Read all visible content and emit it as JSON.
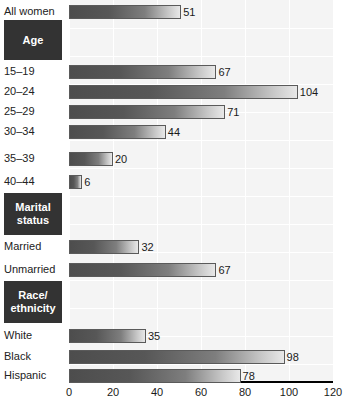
{
  "chart_data": {
    "type": "bar",
    "orientation": "horizontal",
    "title": "",
    "xlabel": "",
    "ylabel": "",
    "xlim": [
      0,
      120
    ],
    "xticks": [
      0,
      20,
      40,
      60,
      80,
      100,
      120
    ],
    "grid": true,
    "legend": null,
    "categories": [
      "All women",
      "15–19",
      "20–24",
      "25–29",
      "30–34",
      "35–39",
      "40–44",
      "Married",
      "Unmarried",
      "White",
      "Black",
      "Hispanic"
    ],
    "values": [
      51,
      67,
      104,
      71,
      44,
      20,
      6,
      32,
      67,
      35,
      98,
      78
    ],
    "group_headers": [
      "Age",
      "Marital status",
      "Race/ethnicity"
    ]
  },
  "rows": [
    {
      "kind": "bar",
      "label": "All women",
      "value": 51,
      "value_text": "51",
      "top": 2
    },
    {
      "kind": "group",
      "label": "Age",
      "top": 20,
      "height": 40
    },
    {
      "kind": "bar",
      "label": "15–19",
      "value": 67,
      "value_text": "67",
      "top": 62
    },
    {
      "kind": "bar",
      "label": "20–24",
      "value": 104,
      "value_text": "104",
      "top": 82
    },
    {
      "kind": "bar",
      "label": "25–29",
      "value": 71,
      "value_text": "71",
      "top": 102
    },
    {
      "kind": "bar",
      "label": "30–34",
      "value": 44,
      "value_text": "44",
      "top": 122
    },
    {
      "kind": "bar",
      "label": "35–39",
      "value": 20,
      "value_text": "20",
      "top": 149
    },
    {
      "kind": "bar",
      "label": "40–44",
      "value": 6,
      "value_text": "6",
      "top": 172
    },
    {
      "kind": "group",
      "label": "Marital\nstatus",
      "top": 193,
      "height": 42
    },
    {
      "kind": "bar",
      "label": "Married",
      "value": 32,
      "value_text": "32",
      "top": 237
    },
    {
      "kind": "bar",
      "label": "Unmarried",
      "value": 67,
      "value_text": "67",
      "top": 260
    },
    {
      "kind": "group",
      "label": "Race/\nethnicity",
      "top": 281,
      "height": 42
    },
    {
      "kind": "bar",
      "label": "White",
      "value": 35,
      "value_text": "35",
      "top": 326
    },
    {
      "kind": "bar",
      "label": "Black",
      "value": 98,
      "value_text": "98",
      "top": 347
    },
    {
      "kind": "bar",
      "label": "Hispanic",
      "value": 78,
      "value_text": "78",
      "top": 366
    }
  ],
  "axis": {
    "ticks": [
      {
        "label": "0",
        "value": 0
      },
      {
        "label": "20",
        "value": 20
      },
      {
        "label": "40",
        "value": 40
      },
      {
        "label": "60",
        "value": 60
      },
      {
        "label": "80",
        "value": 80
      },
      {
        "label": "100",
        "value": 100
      },
      {
        "label": "120",
        "value": 120
      }
    ]
  },
  "colors": {
    "bar_dark": "#4d4d4d",
    "bar_light": "#e8e8e8",
    "bar_border": "#5a5a5a",
    "group_box_bg": "#333333",
    "group_box_text": "#ffffff",
    "plot_bg": "#f4f4f4",
    "grid": "#ffffff",
    "axis": "#000000"
  }
}
